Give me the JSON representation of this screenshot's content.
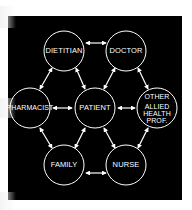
{
  "diagram": {
    "title": "",
    "background_color": "#000000",
    "node_stroke_color": "#ffffff",
    "nodes": [
      {
        "id": "dietitian",
        "label": "DIETITIAN",
        "cx": 64,
        "cy": 51
      },
      {
        "id": "doctor",
        "label": "DOCTOR",
        "cx": 126,
        "cy": 51
      },
      {
        "id": "pharmacist",
        "label": "PHARMACIST",
        "cx": 30,
        "cy": 108
      },
      {
        "id": "patient",
        "label": "PATIENT",
        "cx": 95,
        "cy": 108
      },
      {
        "id": "other",
        "label_line1": "OTHER",
        "label_line2": "ALLIED",
        "label_line3": "HEALTH",
        "label_line4": "PROF.",
        "cx": 157,
        "cy": 108
      },
      {
        "id": "family",
        "label": "FAMILY",
        "cx": 64,
        "cy": 165
      },
      {
        "id": "nurse",
        "label": "NURSE",
        "cx": 126,
        "cy": 165
      }
    ],
    "edges": [
      {
        "from": "dietitian",
        "to": "doctor",
        "type": "bidirectional"
      },
      {
        "from": "dietitian",
        "to": "pharmacist",
        "type": "bidirectional"
      },
      {
        "from": "dietitian",
        "to": "patient",
        "type": "bidirectional"
      },
      {
        "from": "doctor",
        "to": "patient",
        "type": "bidirectional"
      },
      {
        "from": "doctor",
        "to": "other",
        "type": "bidirectional"
      },
      {
        "from": "pharmacist",
        "to": "patient",
        "type": "bidirectional"
      },
      {
        "from": "patient",
        "to": "other",
        "type": "bidirectional"
      },
      {
        "from": "pharmacist",
        "to": "family",
        "type": "bidirectional"
      },
      {
        "from": "patient",
        "to": "family",
        "type": "bidirectional"
      },
      {
        "from": "patient",
        "to": "nurse",
        "type": "bidirectional"
      },
      {
        "from": "other",
        "to": "nurse",
        "type": "bidirectional"
      },
      {
        "from": "family",
        "to": "nurse",
        "type": "bidirectional"
      }
    ]
  }
}
